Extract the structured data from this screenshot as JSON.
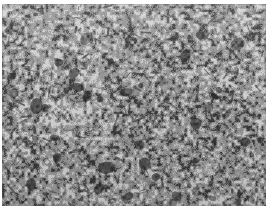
{
  "figure": {
    "kind": "micrograph",
    "caption": "",
    "label": "",
    "scale_bar_text": "",
    "magnification_text": "",
    "panel": {
      "x": 2,
      "y": 4,
      "width": 264,
      "height": 202
    },
    "page": {
      "width": 275,
      "height": 218,
      "background_color": "#ffffff"
    },
    "texture": {
      "matrix_color": "#8a8a8a",
      "dark_grain_color": "#3a3a3a",
      "mid_dark_color": "#5d5d5d",
      "light_grain_color": "#b8b8b8",
      "highlight_color": "#cfcfcf",
      "grain_size_px": 3,
      "dark_fraction": 0.34,
      "light_fraction": 0.26,
      "contrast": 0.62,
      "seed": 20240517,
      "border_color": "#787878"
    }
  }
}
